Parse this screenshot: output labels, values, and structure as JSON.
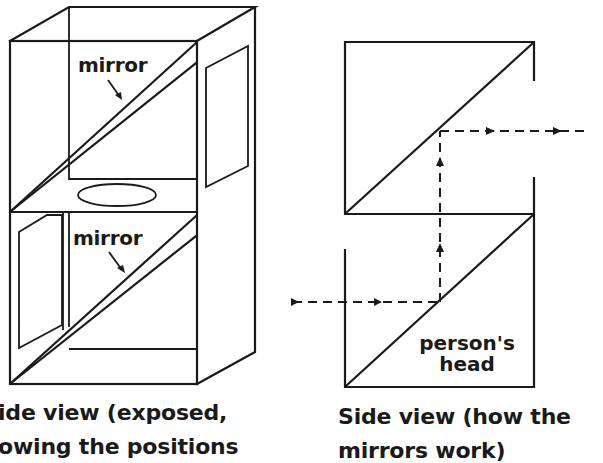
{
  "figure": {
    "left_diagram": {
      "labels": {
        "upper_mirror": "mirror",
        "lower_mirror": "mirror"
      },
      "caption_line1": "ide view (exposed,",
      "caption_line2": "owing the positions"
    },
    "right_diagram": {
      "labels": {
        "head_line1": "person's",
        "head_line2": "head"
      },
      "caption_line1": "Side view (how the",
      "caption_line2": "mirrors work)"
    },
    "colors": {
      "ink": "#1a1a1a",
      "background": "#ffffff"
    }
  }
}
